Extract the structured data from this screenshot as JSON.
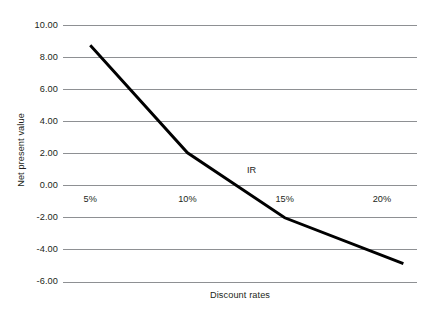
{
  "chart_data": {
    "type": "line",
    "title": "",
    "xlabel": "Discount rates",
    "ylabel": "Net present value",
    "x": [
      5,
      10,
      15,
      20
    ],
    "x_tick_labels": [
      "5%",
      "10%",
      "15%",
      "20%"
    ],
    "y_tick_labels": [
      "10.00",
      "8.00",
      "6.00",
      "4.00",
      "2.00",
      "0.00",
      "-2.00",
      "-4.00",
      "-6.00"
    ],
    "y_ticks": [
      10,
      8,
      6,
      4,
      2,
      0,
      -2,
      -4,
      -6
    ],
    "xlim": [
      3.6,
      21.8
    ],
    "ylim": [
      -6,
      10
    ],
    "grid": true,
    "legend": false,
    "series": [
      {
        "name": "Net present value",
        "x": [
          5,
          10,
          15,
          21.1
        ],
        "values": [
          8.75,
          2.05,
          -2.0,
          -4.85
        ],
        "color": "#000000"
      }
    ],
    "annotations": [
      {
        "text": "IR",
        "x": 13.3,
        "y": 0.95
      }
    ],
    "grid_color": "#8e9093",
    "background_color": "#ffffff",
    "text_color": "#231f20"
  }
}
